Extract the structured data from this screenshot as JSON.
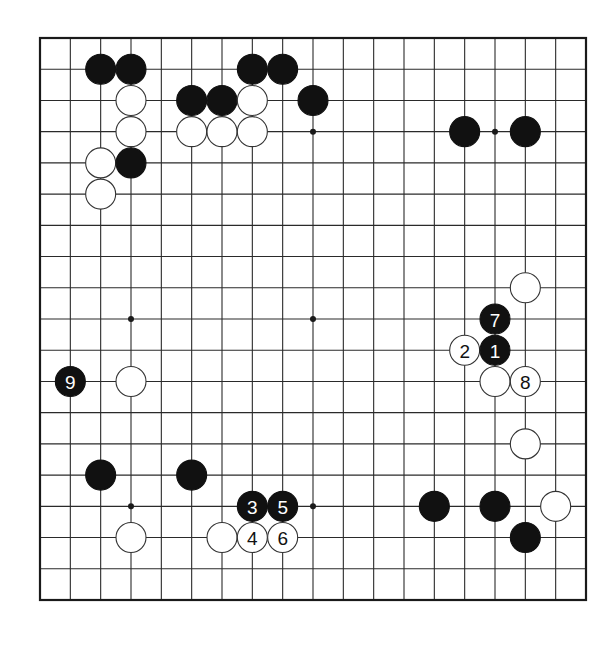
{
  "board": {
    "size": 19,
    "origin_x": 40,
    "origin_y": 38,
    "end_x": 586,
    "end_y": 600,
    "stone_radius": 15,
    "colors": {
      "line": "#2a2a2a",
      "border": "#1a1a1a",
      "black_stone": "#111111",
      "white_stone": "#ffffff",
      "white_stone_edge": "#333333",
      "black_label": "#ffffff",
      "white_label": "#111111"
    },
    "star_points": [
      {
        "col": 4,
        "row": 4
      },
      {
        "col": 10,
        "row": 4
      },
      {
        "col": 16,
        "row": 4
      },
      {
        "col": 4,
        "row": 10
      },
      {
        "col": 10,
        "row": 10
      },
      {
        "col": 16,
        "row": 10
      },
      {
        "col": 4,
        "row": 16
      },
      {
        "col": 10,
        "row": 16
      },
      {
        "col": 16,
        "row": 16
      }
    ],
    "stones": [
      {
        "color": "black",
        "col": 3,
        "row": 2
      },
      {
        "color": "black",
        "col": 4,
        "row": 2
      },
      {
        "color": "black",
        "col": 8,
        "row": 2
      },
      {
        "color": "black",
        "col": 9,
        "row": 2
      },
      {
        "color": "white",
        "col": 4,
        "row": 3
      },
      {
        "color": "black",
        "col": 6,
        "row": 3
      },
      {
        "color": "black",
        "col": 7,
        "row": 3
      },
      {
        "color": "white",
        "col": 8,
        "row": 3
      },
      {
        "color": "black",
        "col": 10,
        "row": 3
      },
      {
        "color": "white",
        "col": 4,
        "row": 4
      },
      {
        "color": "white",
        "col": 6,
        "row": 4
      },
      {
        "color": "white",
        "col": 7,
        "row": 4
      },
      {
        "color": "white",
        "col": 8,
        "row": 4
      },
      {
        "color": "black",
        "col": 15,
        "row": 4
      },
      {
        "color": "black",
        "col": 17,
        "row": 4
      },
      {
        "color": "white",
        "col": 3,
        "row": 5
      },
      {
        "color": "black",
        "col": 4,
        "row": 5
      },
      {
        "color": "white",
        "col": 3,
        "row": 6
      },
      {
        "color": "white",
        "col": 17,
        "row": 9
      },
      {
        "color": "black",
        "col": 16,
        "row": 10,
        "label": "7"
      },
      {
        "color": "white",
        "col": 15,
        "row": 11,
        "label": "2"
      },
      {
        "color": "black",
        "col": 16,
        "row": 11,
        "label": "1"
      },
      {
        "color": "black",
        "col": 2,
        "row": 12,
        "label": "9"
      },
      {
        "color": "white",
        "col": 4,
        "row": 12
      },
      {
        "color": "white",
        "col": 16,
        "row": 12
      },
      {
        "color": "white",
        "col": 17,
        "row": 12,
        "label": "8"
      },
      {
        "color": "white",
        "col": 17,
        "row": 14
      },
      {
        "color": "black",
        "col": 3,
        "row": 15
      },
      {
        "color": "black",
        "col": 6,
        "row": 15
      },
      {
        "color": "black",
        "col": 8,
        "row": 16,
        "label": "3"
      },
      {
        "color": "black",
        "col": 9,
        "row": 16,
        "label": "5"
      },
      {
        "color": "black",
        "col": 14,
        "row": 16
      },
      {
        "color": "black",
        "col": 16,
        "row": 16
      },
      {
        "color": "white",
        "col": 18,
        "row": 16
      },
      {
        "color": "white",
        "col": 4,
        "row": 17
      },
      {
        "color": "white",
        "col": 7,
        "row": 17
      },
      {
        "color": "white",
        "col": 8,
        "row": 17,
        "label": "4"
      },
      {
        "color": "white",
        "col": 9,
        "row": 17,
        "label": "6"
      },
      {
        "color": "black",
        "col": 17,
        "row": 17
      }
    ]
  }
}
